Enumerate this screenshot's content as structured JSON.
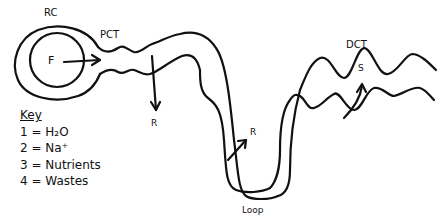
{
  "diagram": {
    "labels": {
      "renal_corpuscle": "RC",
      "proximal_tubule": "PCT",
      "filtration": "F",
      "reabsorption_1": "R",
      "reabsorption_2": "R",
      "loop": "Loop",
      "distal_tubule": "DCT",
      "secretion": "S"
    },
    "key": {
      "title": "Key",
      "items": [
        {
          "label": "1 = H₂O"
        },
        {
          "label": "2 = Na⁺"
        },
        {
          "label": "3 = Nutrients"
        },
        {
          "label": "4 = Wastes"
        }
      ]
    },
    "colors": {
      "stroke": "#111111",
      "background": "#ffffff"
    }
  }
}
